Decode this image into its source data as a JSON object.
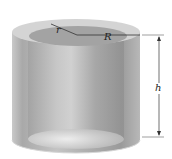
{
  "diagram": {
    "labels": {
      "inner_radius": "r",
      "outer_radius": "R",
      "height": "h"
    },
    "colors": {
      "shell": "#a8a8a8",
      "inner": "#8e8e8e",
      "highlight": "#e6e6e6",
      "line": "#333333"
    }
  }
}
